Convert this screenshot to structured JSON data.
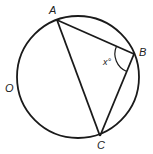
{
  "diagram": {
    "type": "inscribed-triangle-in-circle",
    "circle": {
      "cx": 78,
      "cy": 77,
      "r": 61,
      "center_label": "O"
    },
    "points": {
      "A": {
        "label": "A",
        "x": 57,
        "y": 20
      },
      "B": {
        "label": "B",
        "x": 134,
        "y": 54
      },
      "C": {
        "label": "C",
        "x": 100,
        "y": 136
      }
    },
    "angle": {
      "vertex": "B",
      "label": "x°"
    },
    "segments": [
      "AB",
      "BC",
      "AC"
    ],
    "stroke_color": "#1a1a1a"
  },
  "labels": {
    "A": "A",
    "B": "B",
    "C": "C",
    "O": "O",
    "angle_x": "x°"
  }
}
